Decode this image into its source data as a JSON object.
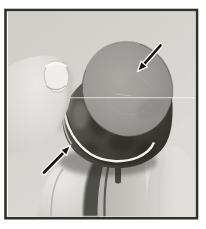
{
  "figure": {
    "alt": "Grayscale photograph of a thumb and fingers holding a small cylindrical metal cap; one black arrow points down-left at the cap's flat top face, a second black arrow points up-right at the thin bright retaining-ring groove near the cap's base",
    "annotations": [
      {
        "name": "top-arrow",
        "points_to": "cylinder top face"
      },
      {
        "name": "ring-arrow",
        "points_to": "retaining ring groove at cylinder base"
      }
    ]
  },
  "colors": {
    "page_bg": "#ffffff",
    "frame": "#31302b",
    "photo_bg_dark": "#cfcec9",
    "photo_bg": "#d6d5d1",
    "photo_bg_light": "#deddd9",
    "skin_light": "#eceae6",
    "skin_mid": "#cdccc8",
    "skin_shadow": "#a6a5a1",
    "nail": "#f0efeb",
    "nail_edge": "#bbbab6",
    "finger_mid": "#b5b4b0",
    "finger_light": "#e2e1dd",
    "gap_dark": "#45443f",
    "cyl_face_light": "#a9a8a3",
    "cyl_face": "#9a9995",
    "cyl_face_edge": "#83827e",
    "cyl_side_light": "#6e6c66",
    "cyl_side": "#4a4842",
    "cyl_side_dark": "#302f29",
    "rim_light": "#e4e3df",
    "ring_white": "#f4f3ef",
    "ring_dark": "#2c2b26",
    "shadow": "#2b2a25",
    "arrow_black": "#161613",
    "arrow_halo": "#f3f2ee",
    "scanline": "#ffffff"
  }
}
